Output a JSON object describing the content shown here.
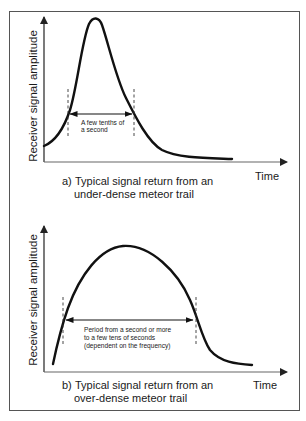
{
  "figure": {
    "panels": [
      {
        "id": "a",
        "y_axis_label": "Receiver signal amplitude",
        "x_axis_label": "Time",
        "caption_prefix": "a)",
        "caption_line1": "Typical signal return from an",
        "caption_line2": "under-dense meteor trail",
        "duration_note_line1": "A few tenths of",
        "duration_note_line2": "a second",
        "curve_shape": "sharp rise to narrow peak, exponential decay"
      },
      {
        "id": "b",
        "y_axis_label": "Receiver signal amplitude",
        "x_axis_label": "Time",
        "caption_prefix": "b)",
        "caption_line1": "Typical signal return from an",
        "caption_line2": "over-dense meteor trail",
        "duration_note_line1": "Period from a second or more",
        "duration_note_line2": "to a few tens of seconds",
        "duration_note_line3": "(dependent on the frequency)",
        "curve_shape": "broad rounded hump, then rapid fall and tail"
      }
    ],
    "colors": {
      "curve": "#111111",
      "axis": "#222222",
      "frame": "#555555",
      "background": "#ffffff"
    }
  }
}
